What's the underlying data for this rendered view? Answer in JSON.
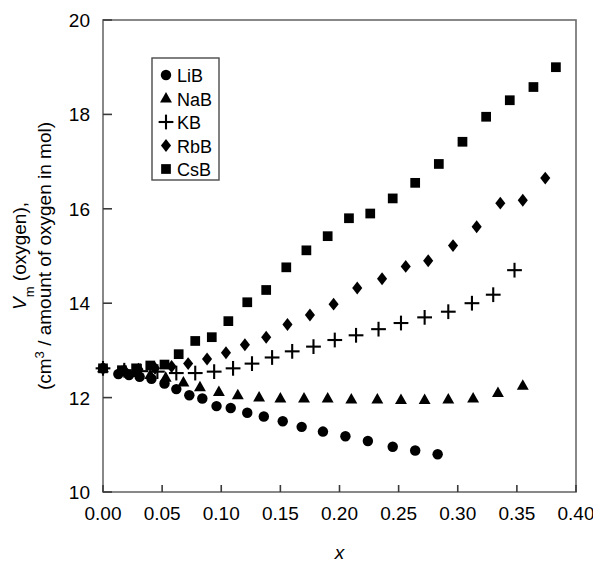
{
  "chart_data": {
    "type": "scatter",
    "title": "",
    "xlabel": "x",
    "ylabel_line1": "V_m (oxygen),",
    "ylabel_line2": "(cm3 / amount of oxygen in mol)",
    "xlim": [
      0.0,
      0.4
    ],
    "ylim": [
      10,
      20
    ],
    "xticks": [
      0.0,
      0.05,
      0.1,
      0.15,
      0.2,
      0.25,
      0.3,
      0.35,
      0.4
    ],
    "xtick_labels": [
      "0.00",
      "0.05",
      "0.10",
      "0.15",
      "0.20",
      "0.25",
      "0.30",
      "0.35",
      "0.40"
    ],
    "yticks": [
      10,
      12,
      14,
      16,
      18,
      20
    ],
    "ytick_labels": [
      "10",
      "12",
      "14",
      "16",
      "18",
      "20"
    ],
    "grid": false,
    "legend_position": "upper-left-inside",
    "marker_color": "#000000",
    "series": [
      {
        "name": "LiB",
        "marker": "circle",
        "points": [
          [
            0.0,
            12.62
          ],
          [
            0.013,
            12.5
          ],
          [
            0.022,
            12.48
          ],
          [
            0.031,
            12.44
          ],
          [
            0.041,
            12.4
          ],
          [
            0.052,
            12.3
          ],
          [
            0.062,
            12.18
          ],
          [
            0.073,
            12.05
          ],
          [
            0.084,
            11.98
          ],
          [
            0.096,
            11.82
          ],
          [
            0.108,
            11.78
          ],
          [
            0.122,
            11.68
          ],
          [
            0.136,
            11.6
          ],
          [
            0.152,
            11.5
          ],
          [
            0.168,
            11.38
          ],
          [
            0.186,
            11.28
          ],
          [
            0.205,
            11.18
          ],
          [
            0.224,
            11.08
          ],
          [
            0.245,
            10.96
          ],
          [
            0.264,
            10.88
          ],
          [
            0.283,
            10.8
          ]
        ]
      },
      {
        "name": "NaB",
        "marker": "triangle",
        "points": [
          [
            0.0,
            12.62
          ],
          [
            0.016,
            12.55
          ],
          [
            0.028,
            12.52
          ],
          [
            0.04,
            12.48
          ],
          [
            0.053,
            12.42
          ],
          [
            0.068,
            12.32
          ],
          [
            0.082,
            12.22
          ],
          [
            0.098,
            12.12
          ],
          [
            0.114,
            12.05
          ],
          [
            0.132,
            12.0
          ],
          [
            0.15,
            11.98
          ],
          [
            0.17,
            11.98
          ],
          [
            0.19,
            11.98
          ],
          [
            0.21,
            11.96
          ],
          [
            0.232,
            11.96
          ],
          [
            0.252,
            11.95
          ],
          [
            0.272,
            11.95
          ],
          [
            0.292,
            11.96
          ],
          [
            0.313,
            11.98
          ],
          [
            0.334,
            12.1
          ],
          [
            0.355,
            12.25
          ]
        ]
      },
      {
        "name": "KB",
        "marker": "plus",
        "points": [
          [
            0.0,
            12.62
          ],
          [
            0.018,
            12.58
          ],
          [
            0.032,
            12.56
          ],
          [
            0.046,
            12.55
          ],
          [
            0.062,
            12.52
          ],
          [
            0.078,
            12.52
          ],
          [
            0.094,
            12.55
          ],
          [
            0.11,
            12.62
          ],
          [
            0.126,
            12.72
          ],
          [
            0.143,
            12.85
          ],
          [
            0.16,
            12.98
          ],
          [
            0.178,
            13.08
          ],
          [
            0.196,
            13.22
          ],
          [
            0.214,
            13.32
          ],
          [
            0.233,
            13.45
          ],
          [
            0.252,
            13.58
          ],
          [
            0.272,
            13.7
          ],
          [
            0.292,
            13.82
          ],
          [
            0.312,
            14.0
          ],
          [
            0.33,
            14.18
          ],
          [
            0.348,
            14.7
          ]
        ]
      },
      {
        "name": "RbB",
        "marker": "diamond",
        "points": [
          [
            0.0,
            12.62
          ],
          [
            0.018,
            12.58
          ],
          [
            0.03,
            12.6
          ],
          [
            0.044,
            12.62
          ],
          [
            0.058,
            12.66
          ],
          [
            0.072,
            12.72
          ],
          [
            0.088,
            12.82
          ],
          [
            0.104,
            12.95
          ],
          [
            0.12,
            13.12
          ],
          [
            0.138,
            13.28
          ],
          [
            0.156,
            13.55
          ],
          [
            0.175,
            13.75
          ],
          [
            0.195,
            13.98
          ],
          [
            0.215,
            14.32
          ],
          [
            0.236,
            14.52
          ],
          [
            0.256,
            14.78
          ],
          [
            0.275,
            14.9
          ],
          [
            0.296,
            15.22
          ],
          [
            0.316,
            15.62
          ],
          [
            0.336,
            16.12
          ],
          [
            0.355,
            16.18
          ],
          [
            0.374,
            16.65
          ]
        ]
      },
      {
        "name": "CsB",
        "marker": "square",
        "points": [
          [
            0.0,
            12.62
          ],
          [
            0.016,
            12.58
          ],
          [
            0.028,
            12.62
          ],
          [
            0.04,
            12.68
          ],
          [
            0.052,
            12.7
          ],
          [
            0.064,
            12.92
          ],
          [
            0.078,
            13.2
          ],
          [
            0.092,
            13.28
          ],
          [
            0.106,
            13.62
          ],
          [
            0.122,
            14.02
          ],
          [
            0.138,
            14.28
          ],
          [
            0.155,
            14.76
          ],
          [
            0.172,
            15.12
          ],
          [
            0.19,
            15.42
          ],
          [
            0.208,
            15.8
          ],
          [
            0.226,
            15.9
          ],
          [
            0.245,
            16.22
          ],
          [
            0.264,
            16.55
          ],
          [
            0.284,
            16.95
          ],
          [
            0.304,
            17.42
          ],
          [
            0.324,
            17.95
          ],
          [
            0.344,
            18.3
          ],
          [
            0.364,
            18.58
          ],
          [
            0.383,
            19.0
          ]
        ]
      }
    ],
    "legend_entries": [
      {
        "label": "LiB",
        "marker": "circle"
      },
      {
        "label": "NaB",
        "marker": "triangle"
      },
      {
        "label": "KB",
        "marker": "plus"
      },
      {
        "label": "RbB",
        "marker": "diamond"
      },
      {
        "label": "CsB",
        "marker": "square"
      }
    ]
  }
}
